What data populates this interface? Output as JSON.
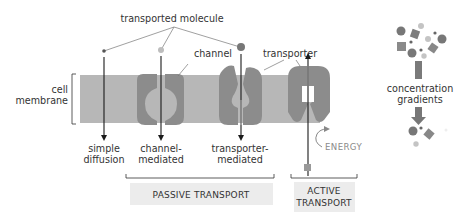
{
  "diagram": {
    "type": "membrane-transport-comparison",
    "labels": {
      "transported_molecule": "transported molecule",
      "channel": "channel",
      "transporter": "transporter",
      "cell_membrane_line1": "cell",
      "cell_membrane_line2": "membrane",
      "concentration_line1": "concentration",
      "concentration_line2": "gradients",
      "energy": "ENERGY"
    },
    "mechanisms": [
      {
        "id": "simple-diffusion",
        "line1": "simple",
        "line2": "diffusion"
      },
      {
        "id": "channel-mediated",
        "line1": "channel-",
        "line2": "mediated"
      },
      {
        "id": "transporter-mediated",
        "line1": "transporter-",
        "line2": "mediated"
      }
    ],
    "groups": {
      "passive": "PASSIVE TRANSPORT",
      "active_line1": "ACTIVE",
      "active_line2": "TRANSPORT"
    },
    "colors": {
      "membrane": "#b7b7b7",
      "protein": "#8c8c8c",
      "molecule_dark": "#777777",
      "molecule_light": "#bdbdbd",
      "arrow": "#1a1a1a",
      "label_box": "#ececec",
      "text": "#333333",
      "energy_text": "#8a8a8a"
    }
  }
}
